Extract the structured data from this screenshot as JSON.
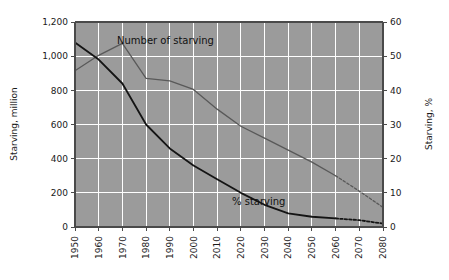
{
  "chart_data": {
    "type": "line",
    "title": "",
    "subtitle": "",
    "xlabel": "",
    "ylabel": "Starving, million",
    "y2label": "Starving, %",
    "xlim": [
      1950,
      2080
    ],
    "ylim": [
      0,
      1200
    ],
    "y2lim": [
      0,
      60
    ],
    "grid": true,
    "legend_position": "inline-annotations",
    "x": [
      1950,
      1960,
      1970,
      1980,
      1990,
      2000,
      2010,
      2020,
      2030,
      2040,
      2050,
      2060,
      2070,
      2080
    ],
    "x_tick_labels": [
      "1950",
      "1960",
      "1970",
      "1980",
      "1990",
      "2000",
      "2010",
      "2020",
      "2030",
      "2040",
      "2050",
      "2060",
      "2070",
      "2080"
    ],
    "y_tick_labels": [
      "0",
      "200",
      "400",
      "600",
      "800",
      "1,000",
      "1,200"
    ],
    "y_tick_values": [
      0,
      200,
      400,
      600,
      800,
      1000,
      1200
    ],
    "y2_tick_labels": [
      "0",
      "10",
      "20",
      "30",
      "40",
      "50",
      "60"
    ],
    "y2_tick_values": [
      0,
      10,
      20,
      30,
      40,
      50,
      60
    ],
    "series": [
      {
        "name": "Number of starving",
        "axis": "left",
        "units": "million",
        "color": "#595959",
        "label_text": "Number of starving",
        "projected_from": 2060,
        "values": [
          915,
          1005,
          1075,
          870,
          855,
          805,
          690,
          590,
          520,
          450,
          380,
          300,
          210,
          115
        ]
      },
      {
        "name": "% starving",
        "axis": "right",
        "units": "%",
        "color": "#141414",
        "label_text": "% starving",
        "projected_from": 2060,
        "values": [
          54,
          49,
          42,
          30,
          23,
          18,
          14,
          10,
          6.5,
          4,
          3,
          2.5,
          2,
          1
        ]
      }
    ],
    "annotations": [
      {
        "text": "Number of starving",
        "x": 1972,
        "y": 1060
      },
      {
        "text": "% starving",
        "x": 2030,
        "y": 150
      }
    ],
    "colors": {
      "plot_background": "#9b9b9b",
      "gridline": "#ffffff",
      "axis": "#4a4a4a",
      "page_background": "#ffffff",
      "number_series": "#595959",
      "pct_series": "#141414"
    }
  }
}
